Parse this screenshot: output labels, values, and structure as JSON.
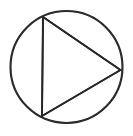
{
  "figure": {
    "background_color": "#ffffff",
    "canvas": {
      "width": 133,
      "height": 136
    },
    "stroke_color": "#262626",
    "circle_stroke_width": 2.1,
    "triangle_stroke_width": 1.7,
    "fill": "none",
    "circle": {
      "name": "circle",
      "center_x": 66.5,
      "center_y": 67,
      "radius": 56
    },
    "triangle": {
      "name": "inscribed-triangle",
      "vertices": [
        {
          "label": "top",
          "x": 43,
          "y": 17
        },
        {
          "label": "right",
          "x": 120.5,
          "y": 70
        },
        {
          "label": "bottom",
          "x": 42,
          "y": 116
        }
      ],
      "points_attr": "43,17 120.5,70 42,116"
    }
  }
}
